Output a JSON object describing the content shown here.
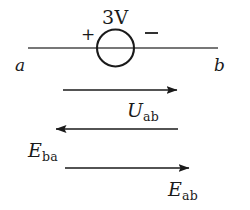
{
  "figure": {
    "type": "circuit-diagram",
    "background_color": "#ffffff",
    "ink_color": "#1a1a1a",
    "circuit": {
      "source_symbol": "circle",
      "source_value": "3V",
      "positive_terminal": "+",
      "negative_terminal": "−",
      "terminal_a": "a",
      "terminal_b": "b"
    },
    "vectors": [
      {
        "label_main": "U",
        "label_sub": "ab",
        "direction": "right"
      },
      {
        "label_main": "E",
        "label_sub": "ba",
        "direction": "left"
      },
      {
        "label_main": "E",
        "label_sub": "ab",
        "direction": "right"
      }
    ]
  }
}
